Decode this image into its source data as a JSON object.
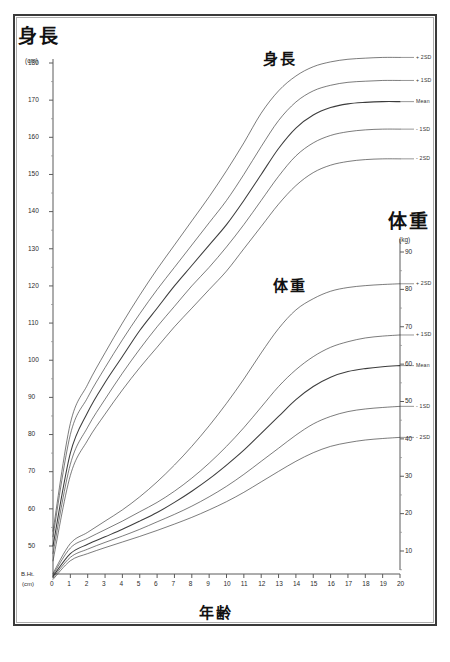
{
  "page": {
    "background": "#ffffff",
    "frame_color": "#3a3a3a",
    "curve_color": "#2b2b2b"
  },
  "titles": {
    "height_main": "身長",
    "weight_main": "体重",
    "height_plot": "身長",
    "weight_plot": "体重",
    "x_axis": "年齢"
  },
  "axes": {
    "left": {
      "unit": "(cm)",
      "baseline_label": "B.Ht.",
      "baseline_unit": "(cm)",
      "ticks": [
        180,
        170,
        160,
        150,
        140,
        130,
        120,
        110,
        100,
        90,
        80,
        70,
        60,
        50
      ]
    },
    "right": {
      "unit": "(kg)",
      "ticks": [
        90,
        80,
        70,
        60,
        50,
        40,
        30,
        20,
        10
      ]
    },
    "bottom": {
      "ticks": [
        0,
        1,
        2,
        3,
        4,
        5,
        6,
        7,
        8,
        9,
        10,
        11,
        12,
        13,
        14,
        15,
        16,
        17,
        18,
        19,
        20
      ]
    }
  },
  "series_labels": [
    "+ 2SD",
    "+ 1SD",
    "Mean",
    "- 1SD",
    "- 2SD"
  ],
  "chart_data": {
    "type": "line",
    "xlabel": "年齢",
    "ylabel": "身長 (cm) / 体重 (kg)",
    "x": [
      0,
      1,
      2,
      3,
      4,
      5,
      6,
      7,
      8,
      9,
      10,
      11,
      12,
      13,
      14,
      15,
      16,
      17,
      18,
      19,
      20
    ],
    "xlim": [
      0,
      20
    ],
    "grid": false,
    "legend": "inline-right",
    "panels": [
      {
        "name": "身長",
        "unit": "cm",
        "axis": "left",
        "ylim": [
          45,
          182
        ],
        "series": [
          {
            "name": "+ 2SD",
            "values": [
              54.0,
              83.0,
              93.5,
              102.0,
              110.0,
              117.5,
              124.5,
              131.0,
              137.5,
              144.0,
              151.0,
              158.5,
              166.5,
              172.5,
              176.5,
              179.0,
              180.3,
              181.0,
              181.3,
              181.5,
              181.5
            ]
          },
          {
            "name": "+ 1SD",
            "values": [
              52.5,
              80.0,
              90.0,
              98.0,
              105.5,
              112.5,
              119.0,
              125.0,
              131.0,
              137.0,
              143.0,
              150.0,
              157.5,
              164.5,
              169.5,
              172.5,
              174.0,
              174.8,
              175.1,
              175.3,
              175.3
            ]
          },
          {
            "name": "Mean",
            "values": [
              50.0,
              75.0,
              86.0,
              94.0,
              101.0,
              108.0,
              114.0,
              120.0,
              125.5,
              131.0,
              136.5,
              143.0,
              150.0,
              157.0,
              162.5,
              166.0,
              168.0,
              169.0,
              169.4,
              169.6,
              169.6
            ]
          },
          {
            "name": "- 1SD",
            "values": [
              48.0,
              72.0,
              82.0,
              89.5,
              96.5,
              103.0,
              109.0,
              114.5,
              120.0,
              125.0,
              130.5,
              136.5,
              143.0,
              149.5,
              155.0,
              158.5,
              160.5,
              161.5,
              162.0,
              162.2,
              162.2
            ]
          },
          {
            "name": "- 2SD",
            "values": [
              46.0,
              69.0,
              78.5,
              85.5,
              92.0,
              98.0,
              103.5,
              109.0,
              114.0,
              119.0,
              124.0,
              130.0,
              136.0,
              142.0,
              147.0,
              150.5,
              152.5,
              153.5,
              154.0,
              154.2,
              154.2
            ]
          }
        ]
      },
      {
        "name": "体重",
        "unit": "kg",
        "axis": "right",
        "ylim": [
          0,
          92
        ],
        "series": [
          {
            "name": "+ 2SD",
            "values": [
              4.0,
              12.0,
              15.0,
              18.0,
              21.0,
              24.5,
              28.5,
              33.0,
              38.0,
              43.5,
              49.5,
              56.0,
              63.0,
              69.5,
              74.5,
              77.5,
              79.5,
              80.5,
              81.0,
              81.3,
              81.5
            ]
          },
          {
            "name": "+ 1SD",
            "values": [
              3.6,
              10.8,
              13.4,
              15.7,
              18.0,
              20.5,
              23.0,
              26.0,
              29.5,
              33.5,
              38.0,
              43.0,
              48.5,
              54.0,
              58.5,
              62.0,
              64.5,
              66.0,
              67.0,
              67.5,
              67.8
            ]
          },
          {
            "name": "Mean",
            "values": [
              3.2,
              9.3,
              11.8,
              13.8,
              15.8,
              18.0,
              20.3,
              23.0,
              26.0,
              29.3,
              33.0,
              37.0,
              41.5,
              46.0,
              50.5,
              54.0,
              56.5,
              58.0,
              58.8,
              59.3,
              59.6
            ]
          },
          {
            "name": "- 1SD",
            "values": [
              2.8,
              8.3,
              10.5,
              12.3,
              14.0,
              15.8,
              17.8,
              19.8,
              22.0,
              24.5,
              27.3,
              30.5,
              34.0,
              37.5,
              41.0,
              44.0,
              46.0,
              47.3,
              48.0,
              48.4,
              48.7
            ]
          },
          {
            "name": "- 2SD",
            "values": [
              2.4,
              7.4,
              9.3,
              10.9,
              12.4,
              13.9,
              15.5,
              17.2,
              19.0,
              21.0,
              23.2,
              25.7,
              28.5,
              31.3,
              34.0,
              36.3,
              38.0,
              39.0,
              39.7,
              40.1,
              40.4
            ]
          }
        ]
      }
    ]
  }
}
